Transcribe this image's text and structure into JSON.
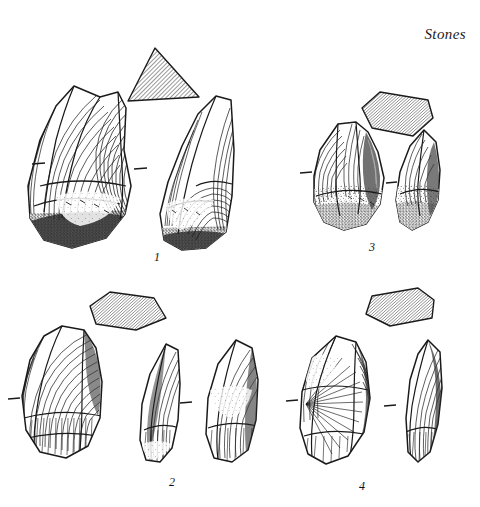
{
  "plate": {
    "title": "Stones",
    "background_color": "#ffffff",
    "ink_color": "#1a1a1a",
    "hatch_color": "#555555",
    "width": 480,
    "height": 507,
    "caption_note": "Archaeological line-drawing plate of four flaked stone artefacts, each shown in two views with a hatched cross-section profile."
  },
  "figures": [
    {
      "id": "figure-1",
      "number": "1",
      "label_x": 157,
      "label_y": 258,
      "section_shape": "triangle",
      "views": [
        "face-view",
        "side-view"
      ],
      "shading": [
        "concentric-ripples",
        "stipple-cortex",
        "dense-stipple-base"
      ]
    },
    {
      "id": "figure-2",
      "number": "2",
      "label_x": 172,
      "label_y": 483,
      "section_shape": "quadrilateral",
      "views": [
        "face-view",
        "profile-view",
        "reverse-view"
      ],
      "shading": [
        "concentric-ripples",
        "fine-hatching"
      ]
    },
    {
      "id": "figure-3",
      "number": "3",
      "label_x": 372,
      "label_y": 248,
      "section_shape": "pentagon",
      "views": [
        "face-view",
        "side-view"
      ],
      "shading": [
        "concentric-ripples",
        "stipple-cortex"
      ]
    },
    {
      "id": "figure-4",
      "number": "4",
      "label_x": 362,
      "label_y": 487,
      "section_shape": "chevron",
      "views": [
        "face-view",
        "edge-view"
      ],
      "shading": [
        "radiating-fan-lines",
        "concentric-ripples",
        "dense-hatching"
      ]
    }
  ],
  "scale_ticks": [
    {
      "name": "tick-fig1-left",
      "x": 38,
      "y": 164
    },
    {
      "name": "tick-fig1-mid",
      "x": 140,
      "y": 168
    },
    {
      "name": "tick-fig3-left",
      "x": 305,
      "y": 172
    },
    {
      "name": "tick-fig3-mid",
      "x": 392,
      "y": 182
    },
    {
      "name": "tick-fig2-left",
      "x": 14,
      "y": 398
    },
    {
      "name": "tick-fig2-mid",
      "x": 186,
      "y": 402
    },
    {
      "name": "tick-fig4-left",
      "x": 292,
      "y": 400
    },
    {
      "name": "tick-fig4-mid",
      "x": 390,
      "y": 405
    }
  ]
}
